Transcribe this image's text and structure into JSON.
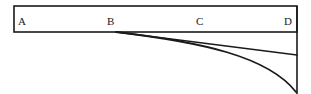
{
  "figure": {
    "background_color": "#ffffff",
    "stroke_color": "#1a1a1a",
    "label_color": "#1a1a1a",
    "labels": [
      {
        "text": "A",
        "x": 18,
        "y": 16
      },
      {
        "text": "B",
        "x": 107,
        "y": 16
      },
      {
        "text": "C",
        "x": 196,
        "y": 16
      },
      {
        "text": "D",
        "x": 284,
        "y": 16
      }
    ],
    "beam_rectangle": {
      "x": 14,
      "y": 6,
      "width": 283,
      "height": 26,
      "stroke_width": 1.6
    },
    "vertical_line": {
      "x": 297,
      "y_start": 6,
      "y_end": 94,
      "stroke_width": 1.6
    },
    "straight_line": {
      "from_x": 116,
      "from_y": 32,
      "to_x": 297,
      "to_y": 55,
      "stroke_width": 1.4
    },
    "deflection_curve": {
      "start_x": 116,
      "start_y": 32,
      "control1_x": 200,
      "control1_y": 42,
      "control2_x": 268,
      "control2_y": 56,
      "end_x": 296,
      "end_y": 92,
      "stroke_width": 1.8
    }
  }
}
